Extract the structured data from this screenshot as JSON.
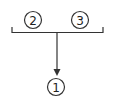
{
  "diagram": {
    "nodes": [
      {
        "id": "2",
        "label": "2",
        "cx": 33,
        "cy": 20
      },
      {
        "id": "3",
        "label": "3",
        "cx": 80,
        "cy": 20
      },
      {
        "id": "1",
        "label": "1",
        "cx": 56,
        "cy": 87
      }
    ],
    "edges": [
      {
        "from": [
          "2",
          "3"
        ],
        "to": "1",
        "type": "bracket-merge-arrow"
      }
    ],
    "colors": {
      "stroke": "#333333",
      "background": "#ffffff"
    }
  }
}
